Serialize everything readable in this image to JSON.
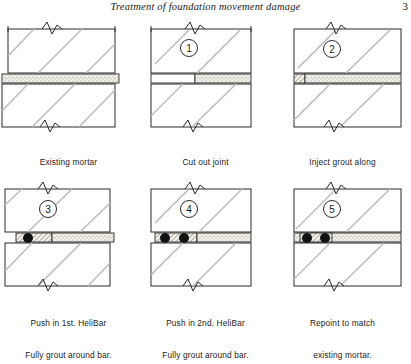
{
  "running_head": {
    "title": "Treatment of foundation movement damage",
    "page_number": "3"
  },
  "figure": {
    "type": "step-sequence-diagram",
    "columns": 3,
    "rows": 2,
    "panels": [
      {
        "id": "panel-1",
        "step_marker": "",
        "caption_line1": "Existing mortar",
        "caption_line2": "joint.",
        "joint_state": "intact-stippled-mortar",
        "bars": 0,
        "grout": "none"
      },
      {
        "id": "panel-2",
        "step_marker": "1",
        "caption_line1": "Cut out joint",
        "caption_line2": "to 50mm. depth.",
        "joint_state": "partially-cut-out",
        "bars": 0,
        "grout": "none"
      },
      {
        "id": "panel-3",
        "step_marker": "2",
        "caption_line1": "Inject grout along",
        "caption_line2": "rear face of groove.",
        "joint_state": "grout-at-rear-face",
        "bars": 0,
        "grout": "rear-face-block"
      },
      {
        "id": "panel-4",
        "step_marker": "3",
        "caption_line1": "Push in 1st. HeliBar",
        "caption_line2": "Fully grout around bar.",
        "joint_state": "one-bar-bedded",
        "bars": 1,
        "grout": "around-first-bar"
      },
      {
        "id": "panel-5",
        "step_marker": "4",
        "caption_line1": "Push in 2nd. HeliBar",
        "caption_line2": "Fully grout around bar.",
        "joint_state": "two-bars-bedded",
        "bars": 2,
        "grout": "around-both-bars"
      },
      {
        "id": "panel-6",
        "step_marker": "5",
        "caption_line1": "Repoint to match",
        "caption_line2": "existing mortar.",
        "joint_state": "repointed",
        "bars": 2,
        "grout": "full-repoint"
      }
    ]
  },
  "style": {
    "line_color": "#2b2b2b",
    "hatch_color": "#b9b9b9",
    "mortar_fill": "#efece4",
    "bar_color": "#111111",
    "paper": "#ffffff"
  }
}
